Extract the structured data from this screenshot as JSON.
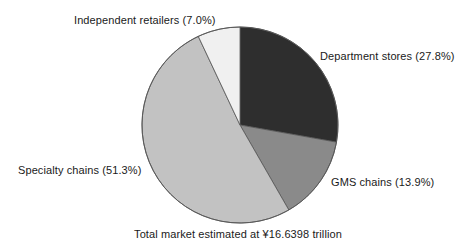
{
  "chart_data": {
    "type": "pie",
    "title": "",
    "caption": "Total market estimated at ¥16.6398 trillion",
    "categories": [
      "Department stores",
      "GMS chains",
      "Specialty chains",
      "Independent retailers"
    ],
    "values": [
      27.8,
      13.9,
      51.3,
      7.0
    ],
    "value_unit": "%",
    "total_market": "¥16.6398 trillion",
    "start_angle_deg": 0,
    "direction": "clockwise",
    "grid": false,
    "legend": "none (direct slice labels)",
    "slices": [
      {
        "label": "Department stores",
        "value": 27.8,
        "label_text": "Department stores (27.8%)",
        "color": "#2e2e2e",
        "label_position": "right-top"
      },
      {
        "label": "GMS chains",
        "value": 13.9,
        "label_text": "GMS chains (13.9%)",
        "color": "#8a8a8a",
        "label_position": "right-bottom"
      },
      {
        "label": "Specialty chains",
        "value": 51.3,
        "label_text": "Specialty chains (51.3%)",
        "color": "#c2c2c2",
        "label_position": "left-bottom"
      },
      {
        "label": "Independent retailers",
        "value": 7.0,
        "label_text": "Independent retailers (7.0%)",
        "color": "#f0f0f0",
        "label_position": "top-left"
      }
    ],
    "colors": {
      "department_stores": "#2e2e2e",
      "gms_chains": "#8a8a8a",
      "specialty_chains": "#c2c2c2",
      "independent_retailers": "#f0f0f0",
      "outline": "#555555",
      "background": "#ffffff",
      "text": "#1a1a1a"
    }
  },
  "labels": {
    "department_stores": "Department stores (27.8%)",
    "gms_chains": "GMS chains (13.9%)",
    "specialty_chains": "Specialty chains (51.3%)",
    "independent_retailers": "Independent retailers (7.0%)"
  },
  "caption": {
    "text": "Total market estimated at ¥16.6398 trillion"
  }
}
